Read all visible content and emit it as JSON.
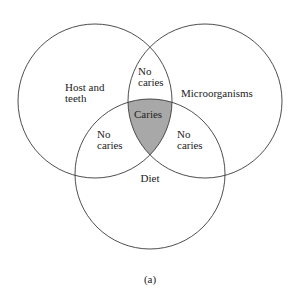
{
  "diagram": {
    "type": "venn",
    "caption": "(a)",
    "shade_color": "#a8a8a8",
    "circles": [
      {
        "id": "host",
        "label_line1": "Host and",
        "label_line2": "teeth",
        "cx": 95,
        "cy": 101,
        "r": 77
      },
      {
        "id": "micro",
        "label": "Microorganisms",
        "cx": 205,
        "cy": 101,
        "r": 77
      },
      {
        "id": "diet",
        "label": "Diet",
        "cx": 150,
        "cy": 174,
        "r": 75
      }
    ],
    "regions": {
      "host_micro": {
        "line1": "No",
        "line2": "caries"
      },
      "host_diet": {
        "line1": "No",
        "line2": "caries"
      },
      "micro_diet": {
        "line1": "No",
        "line2": "caries"
      },
      "all_three": {
        "label": "Caries"
      }
    }
  }
}
